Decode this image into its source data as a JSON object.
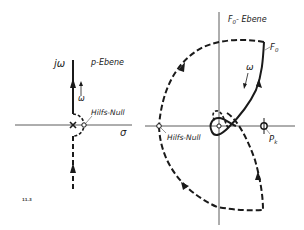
{
  "figure": {
    "number": "11.3",
    "left_panel": {
      "plane_label": "p-Ebene",
      "axis_imag_label": "jω",
      "axis_real_label": "σ",
      "direction_label": "ω",
      "aux_zero_label": "Hilfs-Null"
    },
    "right_panel": {
      "plane_label": "F",
      "plane_label_sub": "0",
      "plane_label_suffix": "- Ebene",
      "curve_label": "F",
      "curve_label_sub": "0",
      "direction_label": "ω",
      "aux_zero_label": "Hilfs-Null",
      "pole_label": "P",
      "pole_label_sub": "k"
    },
    "colors": {
      "line": "#1a1a1a",
      "axis": "#333333",
      "background": "#ffffff"
    }
  }
}
